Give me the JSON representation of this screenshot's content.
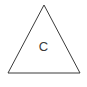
{
  "figure": {
    "name": "triangle-diagram",
    "background_color": "#ffffff",
    "width": 87,
    "height": 87,
    "shape": {
      "type": "triangle",
      "icon_name": "triangle-outline-icon",
      "fill": "none",
      "stroke_color": "#3a3a3a",
      "stroke_width": 1,
      "points": "44,5 80,73 8,73",
      "apex": [
        44,
        5
      ],
      "base_left": [
        8,
        73
      ],
      "base_right": [
        80,
        73
      ]
    },
    "label": {
      "text": "C",
      "color": "#3a3a3a",
      "font_size": 13
    },
    "caption": {
      "text": "",
      "clipped": true,
      "color": "#2b2b2b",
      "font_size": 11
    }
  }
}
